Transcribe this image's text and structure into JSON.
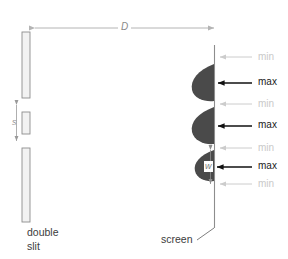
{
  "figure": {
    "type": "physics-diagram",
    "background_color": "#ffffff"
  },
  "captions": {
    "left_line1": "double",
    "left_line2": "slit",
    "right": "screen"
  },
  "dimensions": {
    "distance_label": "D",
    "distance_description": "slit-to-screen separation",
    "slit_separation_label": "s",
    "fringe_width_label": "w"
  },
  "barrier": {
    "segments": [
      {
        "name": "top-plate",
        "top": 32,
        "height": 66
      },
      {
        "name": "middle-plate",
        "top": 112,
        "height": 22
      },
      {
        "name": "bottom-plate",
        "top": 148,
        "height": 74
      }
    ],
    "fill_color": "#f2f2f2",
    "stroke_color": "#8d8d8d"
  },
  "screen": {
    "line_color": "#8d8d8d",
    "top": 45,
    "bottom": 228
  },
  "fringes": [
    {
      "index": 1,
      "label": "min",
      "kind": "minimum",
      "y": 57
    },
    {
      "index": 2,
      "label": "max",
      "kind": "maximum",
      "y": 83
    },
    {
      "index": 3,
      "label": "min",
      "kind": "minimum",
      "y": 104
    },
    {
      "index": 4,
      "label": "max",
      "kind": "maximum",
      "y": 126
    },
    {
      "index": 5,
      "label": "min",
      "kind": "minimum",
      "y": 148
    },
    {
      "index": 6,
      "label": "max",
      "kind": "maximum",
      "y": 167
    },
    {
      "index": 7,
      "label": "min",
      "kind": "minimum",
      "y": 184
    }
  ],
  "colors": {
    "max_text": "#1a1a1a",
    "min_text": "#c9c9c9",
    "max_arrow": "#111111",
    "min_arrow": "#cccccc",
    "lobe_fill": "#4a4a4a",
    "dimension_arrow": "#b4b4b4",
    "caption_text": "#3c3c3c"
  },
  "intensity_lobes": {
    "count": 3,
    "description": "three dark intensity maxima bulging left of the screen line",
    "peak_extent_px": 22
  }
}
